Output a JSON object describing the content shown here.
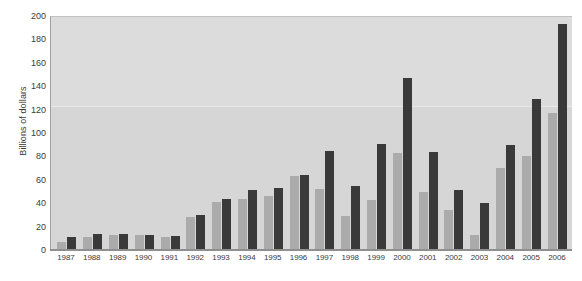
{
  "chart_data": {
    "type": "bar",
    "title": "",
    "subtitle": "",
    "xlabel": "",
    "ylabel": "Billions of dollars",
    "ylim": [
      0,
      200
    ],
    "yticks": [
      0,
      20,
      40,
      60,
      80,
      100,
      120,
      140,
      160,
      180,
      200
    ],
    "ytick_labels": [
      "0",
      "20",
      "40",
      "60",
      "80",
      "100",
      "120",
      "140",
      "160",
      "180",
      "200"
    ],
    "grid": false,
    "legend": "none",
    "categories": [
      "1987",
      "1988",
      "1989",
      "1990",
      "1991",
      "1992",
      "1993",
      "1994",
      "1995",
      "1996",
      "1997",
      "1998",
      "1999",
      "2000",
      "2001",
      "2002",
      "2003",
      "2004",
      "2005",
      "2006"
    ],
    "series": [
      {
        "name": "light-series",
        "color": "#ababab",
        "values": [
          7,
          11,
          13,
          13,
          11,
          28,
          41,
          44,
          46,
          63,
          52,
          29,
          43,
          83,
          50,
          34,
          13,
          70,
          80,
          117
        ]
      },
      {
        "name": "dark-series",
        "color": "#3a3a3a",
        "values": [
          11,
          14,
          14,
          13,
          12,
          30,
          44,
          51,
          53,
          64,
          85,
          55,
          91,
          147,
          84,
          51,
          40,
          90,
          129,
          193
        ]
      }
    ],
    "colors": {
      "plot_background": "#d6d6d6",
      "plot_background_upper": "#dcdcdc",
      "light_bar": "#ababab",
      "dark_bar": "#3a3a3a",
      "axis": "#8f8f8f",
      "text": "#3b3b3b",
      "page_background": "#ffffff"
    }
  }
}
